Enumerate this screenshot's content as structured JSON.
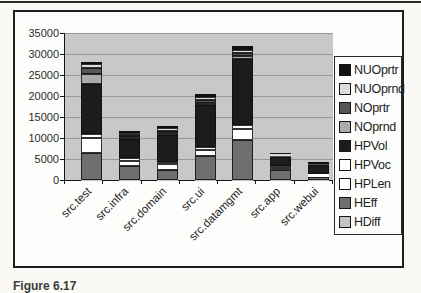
{
  "figure": {
    "caption": "Figure 6.17"
  },
  "colors": {
    "page_bg": "#faf9f6",
    "plot_bg": "#c8c8c8",
    "grid": "#989898",
    "frame_border": "#1f1f1f"
  },
  "chart_data": {
    "type": "bar",
    "stacked": true,
    "title": "",
    "xlabel": "",
    "ylabel": "",
    "categories": [
      "src.test",
      "src.infra",
      "src.domain",
      "src.ui",
      "src.datamgmt",
      "src.app",
      "src.webui"
    ],
    "series": [
      {
        "name": "HDiff",
        "color": "#c4c4c4",
        "values": [
          100,
          100,
          100,
          100,
          100,
          100,
          50
        ]
      },
      {
        "name": "HEff",
        "color": "#6f6f6f",
        "values": [
          6400,
          3200,
          2300,
          5500,
          9400,
          2200,
          700
        ]
      },
      {
        "name": "HPLen",
        "color": "#ffffff",
        "values": [
          3500,
          1300,
          1300,
          1550,
          2600,
          650,
          300
        ]
      },
      {
        "name": "HPVoc",
        "color": "#ffffff",
        "values": [
          900,
          700,
          500,
          700,
          950,
          450,
          300
        ]
      },
      {
        "name": "HPVol",
        "color": "#1c1c1c",
        "values": [
          11900,
          4400,
          6500,
          10000,
          15800,
          2150,
          2300
        ]
      },
      {
        "name": "NOprnd",
        "color": "#ababab",
        "values": [
          2400,
          480,
          480,
          600,
          700,
          150,
          100
        ]
      },
      {
        "name": "NOprtr",
        "color": "#565656",
        "values": [
          1500,
          480,
          480,
          600,
          600,
          120,
          100
        ]
      },
      {
        "name": "NUOprnd",
        "color": "#dcdcdc",
        "values": [
          950,
          600,
          700,
          700,
          700,
          330,
          150
        ]
      },
      {
        "name": "NUOprtr",
        "color": "#111111",
        "values": [
          500,
          480,
          480,
          700,
          950,
          330,
          400
        ]
      }
    ],
    "stack_order_note": "series listed bottom-to-top of stack",
    "ylim": [
      0,
      35000
    ],
    "ytick_step": 5000,
    "yticks": [
      "0",
      "5000",
      "10000",
      "15000",
      "20000",
      "25000",
      "30000",
      "35000"
    ],
    "grid": true,
    "legend_position": "right",
    "legend_order_top_to_bottom": [
      "NUOprtr",
      "NUOprnd",
      "NOprtr",
      "NOprnd",
      "HPVol",
      "HPVoc",
      "HPLen",
      "HEff",
      "HDiff"
    ]
  }
}
